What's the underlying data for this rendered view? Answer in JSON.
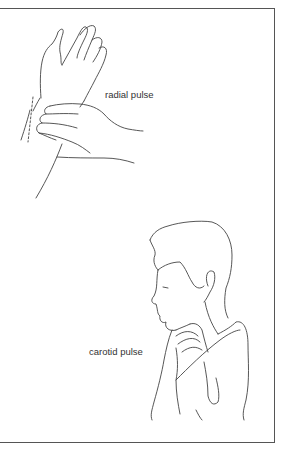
{
  "figure": {
    "labels": {
      "radial": "radial pulse",
      "carotid": "carotid pulse"
    },
    "illustrations": [
      {
        "name": "hand-at-wrist",
        "depicts": "fingers of one hand pressing on the inner wrist of the other"
      },
      {
        "name": "boy-neck",
        "depicts": "boy in profile with fingers pressed to the side of the neck"
      }
    ],
    "colors": {
      "line": "#444444",
      "frame": "#555555",
      "background": "#ffffff"
    }
  }
}
